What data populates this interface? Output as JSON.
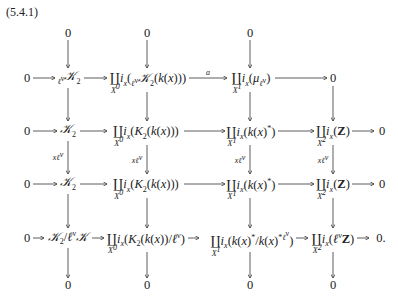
{
  "equation_number": "(5.4.1)",
  "columns_x": [
    68,
    147,
    250,
    333
  ],
  "rows": {
    "top_zeros": [
      "0",
      "0",
      "0"
    ],
    "row1": {
      "left": "0",
      "c1": "ℓ^ν K_2 (ℓ^ν-torsion of K_2)",
      "c2": "∐_{X^0} i_x(ℓ^ν K_2(k(x)))",
      "arrow_c2_c3_label": "a",
      "c3": "∐_{X^1} i_x(μ_{ℓ^ν})",
      "right": "0"
    },
    "row2": {
      "left": "0",
      "c1": "K_2",
      "c2": "∐_{X^0} i_x(K_2(k(x)))",
      "c3": "∐_{X^1} i_x(k(x)^*)",
      "c4": "∐_{X^2} i_x(Z)",
      "right": "0"
    },
    "vertical_label": "xℓ^ν",
    "row3": {
      "left": "0",
      "c1": "K_2",
      "c2": "∐_{X^0} i_x(K_2(k(x)))",
      "c3": "∐_{X^1} i_x(k(x)^*)",
      "c4": "∐_{X^2} i_x(Z)",
      "right": "0"
    },
    "row4": {
      "left": "0",
      "c1": "K_2/ℓ^ν K",
      "c2": "∐_{X^0} i_x(K_2(k(x))/ℓ^ν)",
      "c3": "∐_{X^1} i_x(k(x)^*/k(x)^{*ℓ^ν})",
      "c4": "∐_{X^2} i_x(ℓ^ν Z)",
      "right": "0."
    },
    "bottom_zeros": [
      "0",
      "0",
      "0",
      "0"
    ]
  },
  "text": {
    "zero": "0",
    "zero_dot": "0.",
    "a": "a",
    "xl": "xℓ",
    "nu": "ν",
    "ell": "ℓ",
    "K": "𝒦",
    "two": "2",
    "coprod": "∐",
    "X0": "X",
    "X1": "X",
    "X2": "X",
    "sup0": "0",
    "sup1": "1",
    "sup2": "2",
    "i": "i",
    "x": "x",
    "star": "*",
    "Z": "Z",
    "mu": "μ"
  }
}
